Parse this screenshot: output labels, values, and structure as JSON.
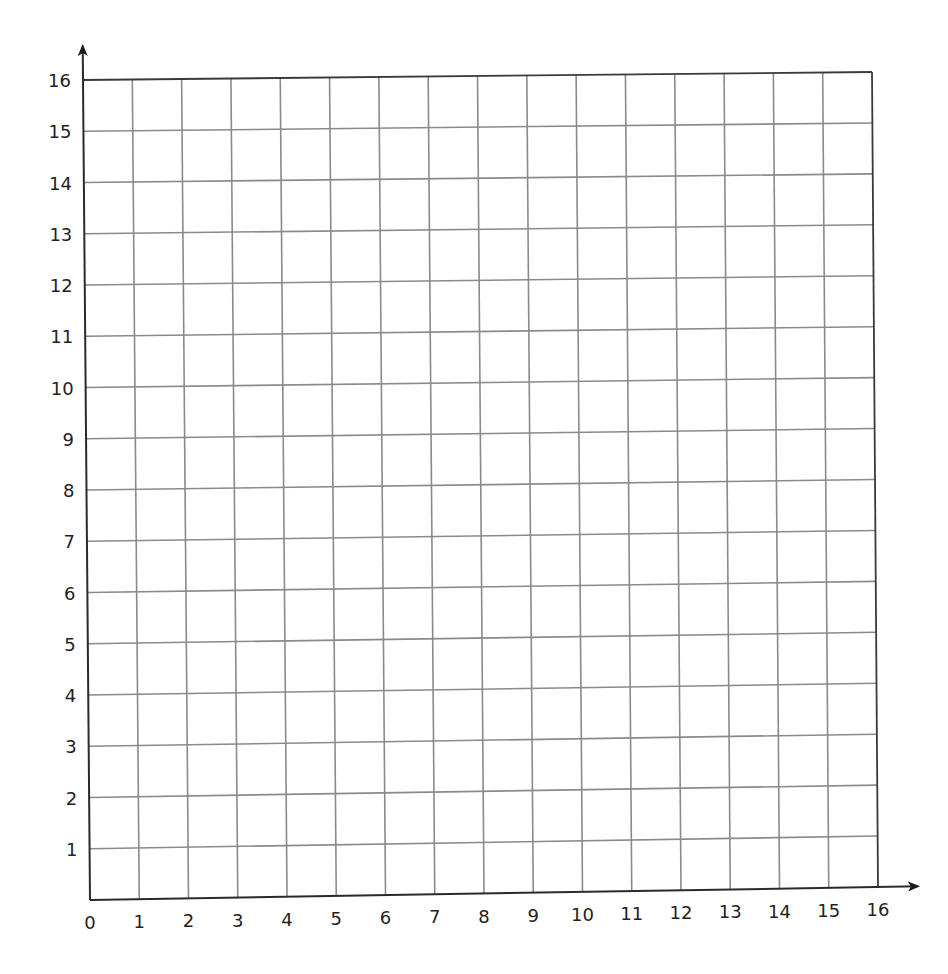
{
  "chart_data": {
    "type": "scatter",
    "title": "",
    "xlabel": "",
    "ylabel": "",
    "x_ticks": [
      "0",
      "1",
      "2",
      "3",
      "4",
      "5",
      "6",
      "7",
      "8",
      "9",
      "10",
      "11",
      "12",
      "13",
      "14",
      "15",
      "16"
    ],
    "y_ticks": [
      "1",
      "2",
      "3",
      "4",
      "5",
      "6",
      "7",
      "8",
      "9",
      "10",
      "11",
      "12",
      "13",
      "14",
      "15",
      "16"
    ],
    "xlim": [
      0,
      16
    ],
    "ylim": [
      0,
      16
    ],
    "grid": true,
    "grid_step": 1,
    "axis_arrows": {
      "x": true,
      "y": true
    },
    "series": [],
    "legend": null
  },
  "style": {
    "grid_color": "#8a8a8a",
    "axis_color": "#2a2a2a",
    "label_color": "#222222",
    "background": "#ffffff"
  }
}
